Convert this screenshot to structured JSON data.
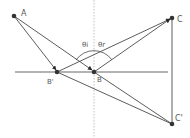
{
  "diagram": {
    "width": 190,
    "height": 138,
    "colors": {
      "line": "#4a4a4a",
      "surface": "#9a9a9a",
      "normal": "#b0b0b0",
      "point": "#333333",
      "label": "#555555"
    },
    "points": {
      "A": {
        "label": "A",
        "x": 14,
        "y": 16
      },
      "B_prime": {
        "label": "B'",
        "x": 57,
        "y": 72
      },
      "B": {
        "label": "B",
        "x": 94,
        "y": 72
      },
      "C": {
        "label": "C",
        "x": 172,
        "y": 18
      },
      "C_prime": {
        "label": "C'",
        "x": 172,
        "y": 124
      }
    },
    "angles": {
      "incidence": {
        "label": "θi"
      },
      "reflection": {
        "label": "θr"
      }
    },
    "surface": {
      "x1": 15,
      "x2": 168,
      "y": 72
    },
    "normal": {
      "x": 94
    }
  }
}
